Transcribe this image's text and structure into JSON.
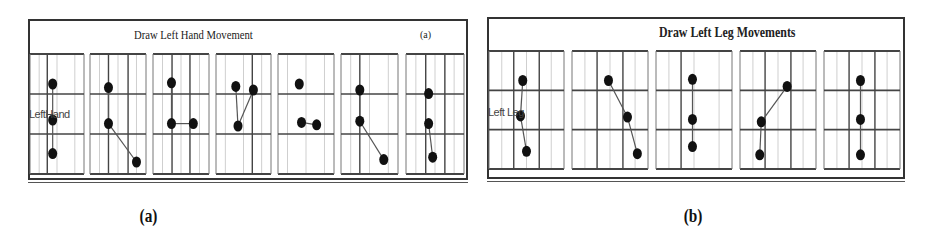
{
  "figure": {
    "panels": [
      {
        "id": "a",
        "title": "Draw Left Hand Movement",
        "tag": "(a)",
        "side_label": "LeftHand",
        "grids": [
          {
            "dots": [
              [
                0.42,
                0.25
              ],
              [
                0.42,
                0.55
              ],
              [
                0.42,
                0.83
              ]
            ],
            "lines": [
              [
                0,
                1
              ],
              [
                1,
                2
              ]
            ]
          },
          {
            "dots": [
              [
                0.33,
                0.28
              ],
              [
                0.33,
                0.58
              ],
              [
                0.83,
                0.9
              ]
            ],
            "lines": [
              [
                0,
                1
              ],
              [
                1,
                2
              ]
            ]
          },
          {
            "dots": [
              [
                0.33,
                0.24
              ],
              [
                0.33,
                0.58
              ],
              [
                0.72,
                0.58
              ]
            ],
            "lines": [
              [
                0,
                1
              ],
              [
                1,
                2
              ]
            ]
          },
          {
            "dots": [
              [
                0.36,
                0.27
              ],
              [
                0.68,
                0.3
              ],
              [
                0.4,
                0.6
              ]
            ],
            "lines": [
              [
                0,
                2
              ],
              [
                1,
                2
              ]
            ]
          },
          {
            "dots": [
              [
                0.38,
                0.25
              ],
              [
                0.42,
                0.57
              ],
              [
                0.69,
                0.59
              ]
            ],
            "lines": [
              [
                1,
                2
              ]
            ]
          },
          {
            "dots": [
              [
                0.33,
                0.3
              ],
              [
                0.33,
                0.56
              ],
              [
                0.75,
                0.88
              ]
            ],
            "lines": [
              [
                0,
                1
              ],
              [
                1,
                2
              ]
            ]
          },
          {
            "dots": [
              [
                0.39,
                0.33
              ],
              [
                0.39,
                0.58
              ],
              [
                0.46,
                0.86
              ]
            ],
            "lines": [
              [
                1,
                2
              ]
            ]
          }
        ]
      },
      {
        "id": "b",
        "title": "Draw Left Leg Movements",
        "tag": "",
        "side_label": "Left Leg",
        "grids": [
          {
            "dots": [
              [
                0.45,
                0.25
              ],
              [
                0.42,
                0.55
              ],
              [
                0.5,
                0.85
              ]
            ],
            "lines": [
              [
                0,
                1
              ],
              [
                1,
                2
              ]
            ]
          },
          {
            "dots": [
              [
                0.48,
                0.25
              ],
              [
                0.73,
                0.56
              ],
              [
                0.86,
                0.87
              ]
            ],
            "lines": [
              [
                0,
                1
              ],
              [
                1,
                2
              ]
            ]
          },
          {
            "dots": [
              [
                0.48,
                0.24
              ],
              [
                0.48,
                0.58
              ],
              [
                0.48,
                0.81
              ]
            ],
            "lines": [
              [
                0,
                1
              ],
              [
                1,
                2
              ]
            ]
          },
          {
            "dots": [
              [
                0.62,
                0.3
              ],
              [
                0.28,
                0.6
              ],
              [
                0.26,
                0.88
              ]
            ],
            "lines": [
              [
                0,
                1
              ],
              [
                1,
                2
              ]
            ]
          },
          {
            "dots": [
              [
                0.48,
                0.25
              ],
              [
                0.48,
                0.58
              ],
              [
                0.48,
                0.88
              ]
            ],
            "lines": [
              [
                0,
                1
              ],
              [
                1,
                2
              ]
            ]
          }
        ]
      }
    ],
    "captions": [
      "(a)",
      "(b)"
    ]
  }
}
